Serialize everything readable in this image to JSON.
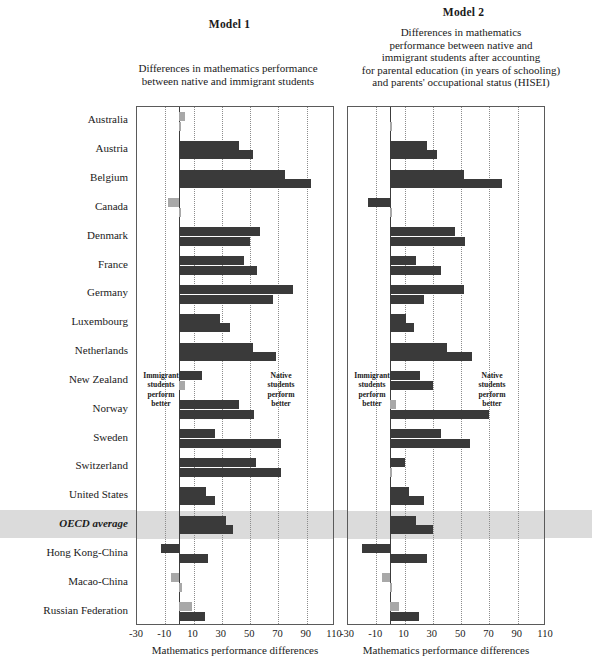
{
  "figure": {
    "categories": [
      "Australia",
      "Austria",
      "Belgium",
      "Canada",
      "Denmark",
      "France",
      "Germany",
      "Luxembourg",
      "Netherlands",
      "New Zealand",
      "Norway",
      "Sweden",
      "Switzerland",
      "United States",
      "OECD average",
      "Hong Kong-China",
      "Macao-China",
      "Russian Federation"
    ],
    "highlight_category": "OECD average",
    "annotation_left": "Immigrant\nstudents\nperform\nbetter",
    "annotation_right": "Native\nstudents\nperform\nbetter",
    "annotation_left_lines": [
      "Immigrant",
      "students",
      "perform",
      "better"
    ],
    "annotation_right_lines": [
      "Native",
      "students",
      "perform",
      "better"
    ],
    "xaxis_label": "Mathematics performance differences",
    "xticks": [
      -30,
      -10,
      10,
      30,
      50,
      70,
      90,
      110
    ],
    "xlim": [
      -30,
      110
    ],
    "colors": {
      "bar_dark": "#3a3a3a",
      "bar_grey": "#a8a8a8",
      "highlight_band": "#cfcfcf",
      "gridline": "#8c8c8c",
      "frame": "#5a5a5a"
    }
  },
  "chart_data": [
    {
      "type": "bar",
      "orientation": "horizontal",
      "panel": "Model 1",
      "title": "Model 1",
      "subtitle": "Differences in mathematics performance between native and immigrant students",
      "subtitle_lines": [
        "Differences in mathematics performance",
        "between native and immigrant students"
      ],
      "xlabel": "Mathematics performance differences",
      "ylabel": "",
      "xlim": [
        -30,
        110
      ],
      "xticks": [
        -30,
        -10,
        10,
        30,
        50,
        70,
        90,
        110
      ],
      "grid": true,
      "legend": "none",
      "categories": [
        "Australia",
        "Austria",
        "Belgium",
        "Canada",
        "Denmark",
        "France",
        "Germany",
        "Luxembourg",
        "Netherlands",
        "New Zealand",
        "Norway",
        "Sweden",
        "Switzerland",
        "United States",
        "OECD average",
        "Hong Kong-China",
        "Macao-China",
        "Russian Federation"
      ],
      "series": [
        {
          "name": "First-generation students",
          "values": [
            4,
            42,
            75,
            -8,
            57,
            46,
            80,
            29,
            52,
            16,
            42,
            25,
            54,
            19,
            33,
            -13,
            -6,
            9
          ],
          "shading": [
            "grey",
            "dark",
            "dark",
            "grey",
            "dark",
            "dark",
            "dark",
            "dark",
            "dark",
            "dark",
            "dark",
            "dark",
            "dark",
            "dark",
            "dark",
            "dark",
            "grey",
            "grey"
          ]
        },
        {
          "name": "Second-generation students",
          "values": [
            1,
            52,
            93,
            1,
            50,
            55,
            66,
            36,
            68,
            4,
            53,
            72,
            72,
            25,
            38,
            20,
            2,
            18
          ],
          "shading": [
            "grey",
            "dark",
            "dark",
            "grey",
            "dark",
            "dark",
            "dark",
            "dark",
            "dark",
            "grey",
            "dark",
            "dark",
            "dark",
            "dark",
            "dark",
            "dark",
            "grey",
            "dark"
          ]
        }
      ]
    },
    {
      "type": "bar",
      "orientation": "horizontal",
      "panel": "Model 2",
      "title": "Model 2",
      "subtitle": "Differences in mathematics performance between native and immigrant students after accounting for parental education (in years of schooling) and parents' occupational status (HISEI)",
      "subtitle_lines": [
        "Differences in mathematics",
        "performance between native and",
        "immigrant students after accounting",
        "for parental education (in years of schooling)",
        "and parents' occupational status (HISEI)"
      ],
      "xlabel": "Mathematics performance differences",
      "ylabel": "",
      "xlim": [
        -30,
        110
      ],
      "xticks": [
        -30,
        -10,
        10,
        30,
        50,
        70,
        90,
        110
      ],
      "grid": true,
      "legend": "none",
      "categories": [
        "Australia",
        "Austria",
        "Belgium",
        "Canada",
        "Denmark",
        "France",
        "Germany",
        "Luxembourg",
        "Netherlands",
        "New Zealand",
        "Norway",
        "Sweden",
        "Switzerland",
        "United States",
        "OECD average",
        "Hong Kong-China",
        "Macao-China",
        "Russian Federation"
      ],
      "series": [
        {
          "name": "First-generation students",
          "values": [
            0,
            26,
            52,
            -16,
            46,
            18,
            52,
            11,
            40,
            21,
            4,
            36,
            10,
            13,
            18,
            -20,
            -6,
            6
          ],
          "shading": [
            "grey",
            "dark",
            "dark",
            "dark",
            "dark",
            "dark",
            "dark",
            "dark",
            "dark",
            "dark",
            "grey",
            "dark",
            "dark",
            "dark",
            "dark",
            "dark",
            "grey",
            "grey"
          ]
        },
        {
          "name": "Second-generation students",
          "values": [
            1,
            33,
            79,
            1,
            53,
            36,
            24,
            17,
            58,
            30,
            70,
            56,
            1,
            24,
            30,
            26,
            1,
            20
          ],
          "shading": [
            "grey",
            "dark",
            "dark",
            "grey",
            "dark",
            "dark",
            "dark",
            "dark",
            "dark",
            "dark",
            "dark",
            "dark",
            "grey",
            "dark",
            "dark",
            "dark",
            "grey",
            "dark"
          ]
        }
      ]
    }
  ]
}
